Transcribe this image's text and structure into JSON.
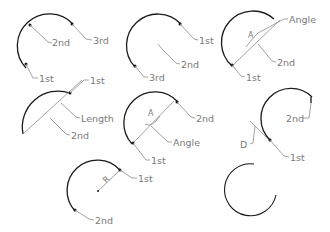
{
  "colors": {
    "arc": "#1a1a1a",
    "leader": "#8a8a8a",
    "label": "#7a7a7a",
    "background": "#ffffff"
  },
  "diagrams": [
    {
      "method": "three-point",
      "labels": {
        "a": "2nd",
        "b": "3rd",
        "c": "1st"
      }
    },
    {
      "method": "start-center-end",
      "labels": {
        "a": "1st",
        "b": "2nd",
        "c": "3rd"
      }
    },
    {
      "method": "start-center-angle",
      "labels": {
        "a": "Angle",
        "b": "2nd",
        "c": "1st",
        "sym": "A"
      }
    },
    {
      "method": "start-center-length",
      "labels": {
        "a": "1st",
        "b": "Length",
        "c": "2nd"
      }
    },
    {
      "method": "start-end-angle",
      "labels": {
        "a": "2nd",
        "b": "Angle",
        "c": "1st",
        "sym": "A"
      }
    },
    {
      "method": "start-end-direction",
      "labels": {
        "a": "2nd",
        "b": "D",
        "c": "1st"
      }
    },
    {
      "method": "start-end-radius",
      "labels": {
        "a": "1st",
        "b": "2nd",
        "sym": "R"
      }
    },
    {
      "method": "continue",
      "labels": {}
    }
  ]
}
